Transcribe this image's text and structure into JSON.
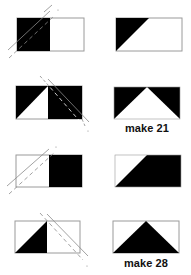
{
  "colors": {
    "fill": "#000000",
    "background": "#ffffff",
    "outline": "#9a9a9a",
    "guide": "#8a8a8a"
  },
  "steps": [
    {
      "id": "step-1",
      "description": "Place black square on left of white rectangle, sew along diagonal guide lines",
      "before": {
        "rect": [
          17,
          18,
          67,
          33
        ],
        "square": "left",
        "square_color": "black"
      },
      "after": {
        "rect": [
          116,
          18,
          66,
          33
        ],
        "triangle": "top-left black"
      }
    },
    {
      "id": "step-2",
      "description": "Place black square on right, sew along opposite diagonal",
      "before": {
        "rect": [
          16,
          86,
          66,
          33
        ],
        "square": "right",
        "square_color": "black"
      },
      "after": {
        "rect": [
          114,
          87,
          66,
          32
        ],
        "triangle": "white center, black corners"
      },
      "caption": "make 21"
    },
    {
      "id": "step-3",
      "description": "Place white square on left of black rectangle, sew along diagonal",
      "before": {
        "rect": [
          16,
          155,
          66,
          32
        ],
        "square": "left",
        "square_color": "white"
      },
      "after": {
        "rect": [
          115,
          155,
          66,
          32
        ],
        "triangle": "top-left white"
      }
    },
    {
      "id": "step-4",
      "description": "Place white square on right, sew along opposite diagonal",
      "before": {
        "rect": [
          15,
          221,
          65,
          32
        ],
        "square": "right",
        "square_color": "white"
      },
      "after": {
        "rect": [
          113,
          221,
          66,
          32
        ],
        "triangle": "black center, white corners"
      },
      "caption": "make 28"
    }
  ],
  "captions": {
    "step2": "make 21",
    "step4": "make 28"
  }
}
